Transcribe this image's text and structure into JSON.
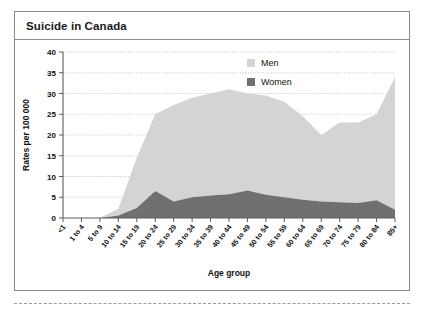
{
  "figure": {
    "title": "Suicide in Canada"
  },
  "chart_data": {
    "type": "area",
    "stacked": true,
    "title": "Suicide in Canada",
    "xlabel": "Age group",
    "ylabel": "Rates per 100 000",
    "ylim": [
      0,
      40
    ],
    "yticks": [
      0,
      5,
      10,
      15,
      20,
      25,
      30,
      35,
      40
    ],
    "grid": true,
    "legend_position": "top-right",
    "categories": [
      "<1",
      "1 to 4",
      "5 to 9",
      "10 to 14",
      "15 to 19",
      "20 to 24",
      "25 to 29",
      "30 to 34",
      "35 to 39",
      "40 to 44",
      "45 to 49",
      "50 to 54",
      "55 to 59",
      "60 to 64",
      "65 to 69",
      "70 to 74",
      "75 to 79",
      "80 to 84",
      "85+"
    ],
    "series": [
      {
        "name": "Women",
        "color": "#707070",
        "values": [
          0,
          0,
          0,
          0.6,
          2.4,
          6.5,
          4.0,
          5.0,
          5.4,
          5.7,
          6.6,
          5.6,
          5.0,
          4.4,
          4.0,
          3.8,
          3.6,
          4.3,
          2.0
        ]
      },
      {
        "name": "Men",
        "color": "#d4d4d4",
        "values": [
          0,
          0,
          0,
          1.6,
          12.1,
          18.5,
          23.2,
          24.0,
          24.6,
          25.3,
          23.4,
          23.9,
          23.0,
          20.1,
          16.0,
          19.2,
          19.4,
          20.7,
          32.0
        ]
      }
    ],
    "totals": [
      0,
      0,
      0,
      2.2,
      14.5,
      25.0,
      27.2,
      29.0,
      30.0,
      31.0,
      30.0,
      29.5,
      28.0,
      24.5,
      20.0,
      23.0,
      23.0,
      25.0,
      34.0
    ]
  },
  "legend": {
    "entries": [
      {
        "label": "Men",
        "color": "#d4d4d4"
      },
      {
        "label": "Women",
        "color": "#707070"
      }
    ]
  }
}
